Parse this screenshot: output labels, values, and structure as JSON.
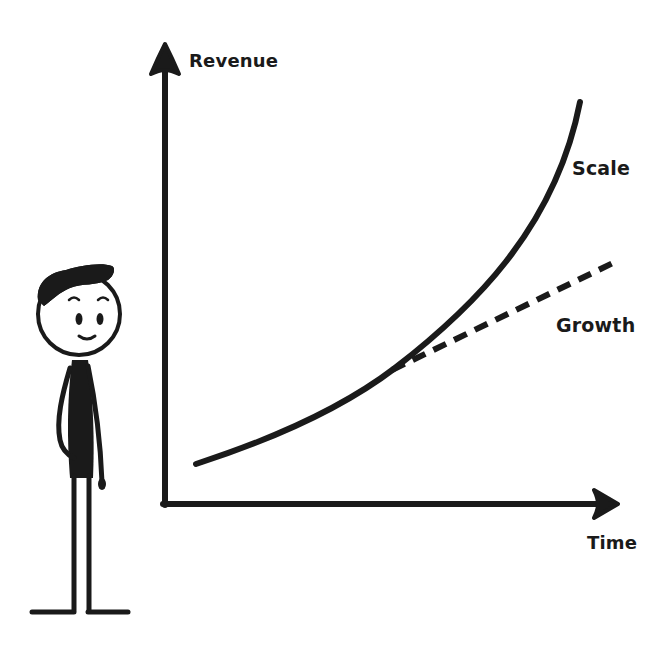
{
  "diagram": {
    "axes": {
      "y_label": "Revenue",
      "x_label": "Time"
    },
    "curves": [
      {
        "name": "Scale",
        "style": "solid",
        "shape": "exponential"
      },
      {
        "name": "Growth",
        "style": "dashed",
        "shape": "linear"
      }
    ],
    "labels": {
      "scale": "Scale",
      "growth": "Growth"
    },
    "figure": "stick-figure-person",
    "colors": {
      "ink": "#1a1a1a",
      "background": "#ffffff"
    }
  }
}
